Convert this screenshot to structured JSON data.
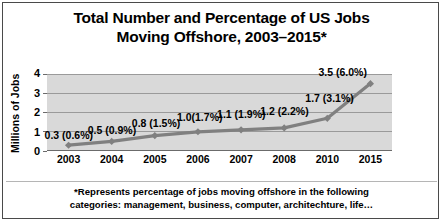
{
  "title_lines": [
    "Total Number and Percentage of US Jobs",
    "Moving Offshore, 2003–2015*"
  ],
  "footnote_lines": [
    "*Represents percentage of jobs moving offshore in the following",
    "categories: management, business, computer, architechture, life…"
  ],
  "colors": {
    "plot_background": "#d9d9d9",
    "gridline": "#9a9a9a",
    "series_line": "#808080",
    "frame_border": "#4a4a4a",
    "text": "#000000"
  },
  "chart_data": {
    "type": "line",
    "title": "Total Number and Percentage of US Jobs Moving Offshore, 2003–2015*",
    "xlabel": "",
    "ylabel": "Millions of Jobs",
    "categories": [
      "2003",
      "2004",
      "2005",
      "2006",
      "2007",
      "2008",
      "2010",
      "2015"
    ],
    "values": [
      0.3,
      0.5,
      0.8,
      1.0,
      1.1,
      1.2,
      1.7,
      3.5
    ],
    "percentages": [
      "0.6%",
      "0.9%",
      "1.5%",
      "1.7%",
      "1.9%",
      "2.2%",
      "3.1%",
      "6.0%"
    ],
    "point_labels": [
      "0.3 (0.6%)",
      "0.5 (0.9%)",
      "0.8 (1.5%)",
      "1.0(1.7%)",
      "1.1 (1.9%)",
      "1.2 (2.2%)",
      "1.7 (3.1%)",
      "3.5 (6.0%)"
    ],
    "yticks": [
      "0",
      "1",
      "2",
      "3",
      "4"
    ],
    "ylim": [
      0,
      4
    ],
    "grid": true,
    "legend": "none",
    "marker": "diamond"
  }
}
